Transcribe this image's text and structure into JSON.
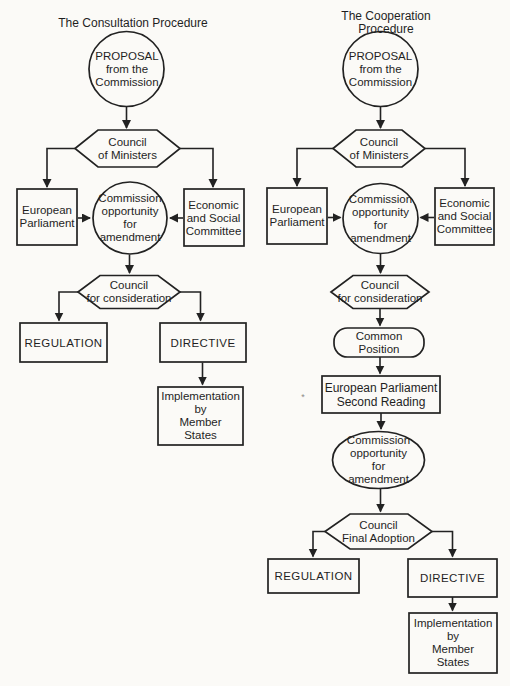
{
  "consultation": {
    "title": "The Consultation Procedure",
    "proposal": "PROPOSAL\nfrom the\nCommission",
    "council_of_ministers": "Council\nof Ministers",
    "european_parliament": "European\nParliament",
    "commission_amendment": "Commission\nopportunity\nfor\namendment",
    "economic_social_committee": "Economic\nand Social\nCommittee",
    "council_for_consideration": "Council\nfor consideration",
    "regulation": "REGULATION",
    "directive": "DIRECTIVE",
    "implementation": "Implementation\nby\nMember\nStates"
  },
  "cooperation": {
    "title": "The Cooperation Procedure",
    "proposal": "PROPOSAL\nfrom the\nCommission",
    "council_of_ministers": "Council\nof Ministers",
    "european_parliament": "European\nParliament",
    "commission_amendment": "Commission\nopportunity\nfor\namendment",
    "economic_social_committee": "Economic\nand Social\nCommittee",
    "council_for_consideration": "Council\nfor consideration",
    "common_position": "Common\nPosition",
    "ep_second_reading": "European Parliament\nSecond Reading",
    "commission_amendment_2": "Commission\nopportunity\nfor\namendment",
    "council_final_adoption": "Council\nFinal Adoption",
    "regulation": "REGULATION",
    "directive": "DIRECTIVE",
    "implementation": "Implementation\nby\nMember\nStates"
  },
  "annotations": {
    "footnote_mark": "*"
  },
  "colors": {
    "ink": "#222222",
    "paper": "#fbfaf7"
  }
}
